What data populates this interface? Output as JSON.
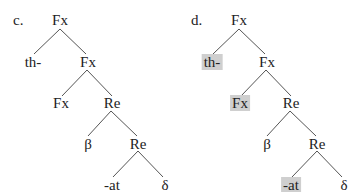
{
  "trees": [
    {
      "label": "c.",
      "nodes": {
        "root": "Fx",
        "left1": "th-",
        "right1": "Fx",
        "left2": "Fx",
        "right2": "Re",
        "left3": "β",
        "right3": "Re",
        "left4": "-at",
        "right4": "δ"
      },
      "highlighted": []
    },
    {
      "label": "d.",
      "nodes": {
        "root": "Fx",
        "left1": "th-",
        "right1": "Fx",
        "left2": "Fx",
        "right2": "Re",
        "left3": "β",
        "right3": "Re",
        "left4": "-at",
        "right4": "δ"
      },
      "highlighted": [
        "th-",
        "Fx",
        "-at"
      ],
      "highlight_color": "#cfcfcf"
    }
  ]
}
